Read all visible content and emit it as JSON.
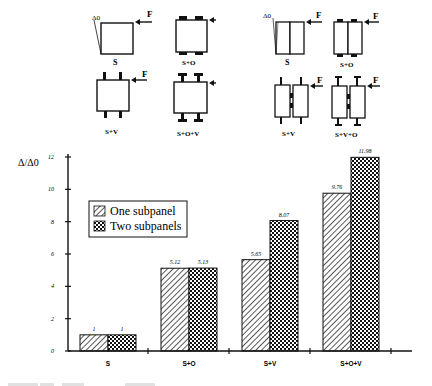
{
  "diagrams": {
    "one_subpanel": [
      {
        "label": "S",
        "delta_label": "Δ0",
        "force_label": "F"
      },
      {
        "label": "S+O",
        "force_label": "F"
      },
      {
        "label": "S+V",
        "force_label": "F"
      },
      {
        "label": "S+O+V",
        "force_label": "F"
      }
    ],
    "two_subpanels": [
      {
        "label": "S",
        "delta_label": "Δ0",
        "force_label": "F"
      },
      {
        "label": "S+O",
        "force_label": "F"
      },
      {
        "label": "S+V",
        "force_label": "F"
      },
      {
        "label": "S+V+O",
        "force_label": "F"
      }
    ]
  },
  "chart_data": {
    "type": "bar",
    "title": "",
    "xlabel": "",
    "ylabel": "Δ/Δ0",
    "ylim": [
      0,
      12
    ],
    "yticks": [
      0,
      2,
      4,
      6,
      8,
      10,
      12
    ],
    "grid": false,
    "legend_position": "upper left (inside)",
    "categories": [
      "S",
      "S+O",
      "S+V",
      "S+O+V"
    ],
    "series": [
      {
        "name": "One subpanel",
        "pattern": "diagonal-hatch",
        "values": [
          1,
          5.12,
          5.65,
          9.76
        ],
        "labels": [
          "1",
          "5.12",
          "5.65",
          "9.76"
        ]
      },
      {
        "name": "Two subpanels",
        "pattern": "checker-hatch",
        "values": [
          1,
          5.13,
          8.07,
          11.98
        ],
        "labels": [
          "1",
          "5.13",
          "8.07",
          "11.98"
        ]
      }
    ]
  }
}
